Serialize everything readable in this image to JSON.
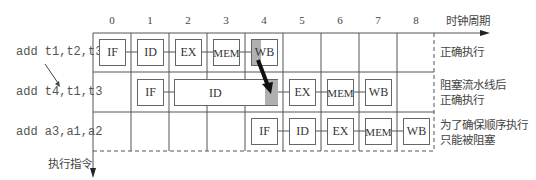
{
  "axis": {
    "x_label": "时钟周期",
    "y_label": "执行指令",
    "ticks": [
      "0",
      "1",
      "2",
      "3",
      "4",
      "5",
      "6",
      "7",
      "8"
    ]
  },
  "rows": [
    {
      "instruction": "add t1,t2,t3",
      "note": [
        "正确执行"
      ],
      "stages": [
        {
          "label": "IF",
          "cycle": 0
        },
        {
          "label": "ID",
          "cycle": 1
        },
        {
          "label": "EX",
          "cycle": 2
        },
        {
          "label": "MEM",
          "cycle": 3
        },
        {
          "label": "WB",
          "cycle": 4,
          "highlight": true
        }
      ]
    },
    {
      "instruction": "add t4,t1,t3",
      "note": [
        "阻塞流水线后",
        "正确执行"
      ],
      "stages": [
        {
          "label": "IF",
          "cycle": 1
        },
        {
          "label": "ID",
          "cycle": "2-4",
          "stalled": true
        },
        {
          "label": "EX",
          "cycle": 5
        },
        {
          "label": "MEM",
          "cycle": 6
        },
        {
          "label": "WB",
          "cycle": 7
        }
      ]
    },
    {
      "instruction": "add a3,a1,a2",
      "note": [
        "为了确保顺序执行",
        "只能被阻塞"
      ],
      "stages": [
        {
          "label": "IF",
          "cycle": 4
        },
        {
          "label": "ID",
          "cycle": 5
        },
        {
          "label": "EX",
          "cycle": 6
        },
        {
          "label": "MEM",
          "cycle": 7
        },
        {
          "label": "WB",
          "cycle": 8
        }
      ]
    }
  ],
  "colors": {
    "highlight": "#b0b0b0",
    "grid": "#555555",
    "arrow": "#111111"
  }
}
